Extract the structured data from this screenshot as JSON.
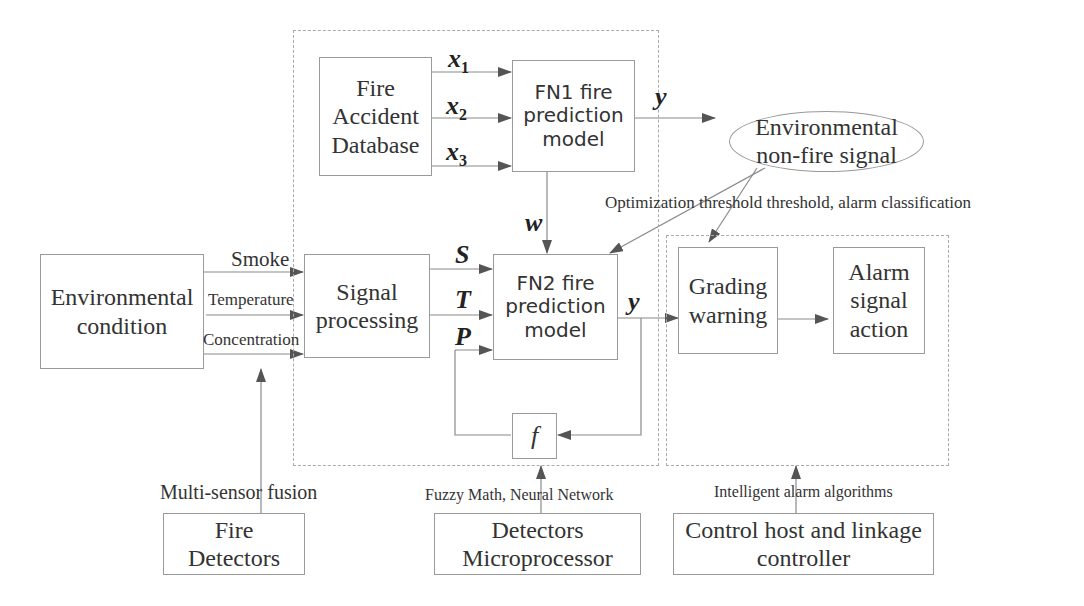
{
  "diagram": {
    "nodes": {
      "fire_accident_database": "Fire\nAccident\nDatabase",
      "fn1_model": "FN1 fire\nprediction\nmodel",
      "environmental_condition": "Environmental\ncondition",
      "signal_processing": "Signal\nprocessing",
      "fn2_model": "FN2 fire\nprediction\nmodel",
      "f_block": "f",
      "environmental_non_fire_signal": "Environmental\nnon-fire signal",
      "grading_warning": "Grading\nwarning",
      "alarm_signal_action": "Alarm\nsignal\naction",
      "fire_detectors": "Fire\nDetectors",
      "detectors_microprocessor": "Detectors\nMicroprocessor",
      "control_host": "Control host and linkage\ncontroller"
    },
    "variables": {
      "x1": "x",
      "x1_sub": "1",
      "x2": "x",
      "x2_sub": "2",
      "x3": "x",
      "x3_sub": "3",
      "y_top": "y",
      "w": "w",
      "S": "S",
      "T": "T",
      "P": "P",
      "y_mid": "y"
    },
    "edge_labels": {
      "smoke": "Smoke",
      "temperature": "Temperature",
      "concentration": "Concentration",
      "optimization": "Optimization threshold threshold, alarm classification",
      "multi_sensor": "Multi-sensor fusion",
      "fuzzy": "Fuzzy Math, Neural Network",
      "intelligent": "Intelligent alarm algorithms"
    },
    "colors": {
      "line": "#8a8a8a",
      "arrow": "#555555",
      "border": "#9a9a9a"
    }
  }
}
